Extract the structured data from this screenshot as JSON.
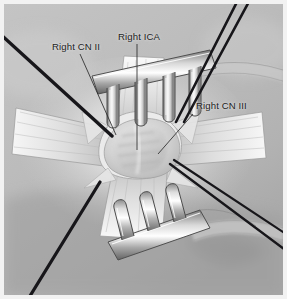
{
  "figure": {
    "kind": "surgical-anatomy-illustration",
    "background_color": "#b9b9b9",
    "plate_border_color": "#f2f2f2",
    "ink_color": "#1d1d1d"
  },
  "labels": [
    {
      "id": "cn2",
      "text": "Right CN II",
      "leader": {
        "from_x": 76,
        "from_y": 50,
        "to_x": 112,
        "to_y": 131
      }
    },
    {
      "id": "ica",
      "text": "Right ICA",
      "leader": {
        "from_x": 137,
        "from_y": 40,
        "to_x": 137,
        "to_y": 146
      }
    },
    {
      "id": "cn3",
      "text": "Right CN III",
      "leader": {
        "from_x": 193,
        "from_y": 110,
        "to_x": 158,
        "to_y": 150
      }
    }
  ],
  "instruments": {
    "top_retractor_prongs": 4,
    "bottom_retractor_prongs": 3,
    "suture_count": 6,
    "suture_color": "#17161a"
  },
  "anatomy": {
    "dural_opening": "cruciate / star-shaped",
    "central_structure": "Right ICA",
    "flap_count": 4
  }
}
